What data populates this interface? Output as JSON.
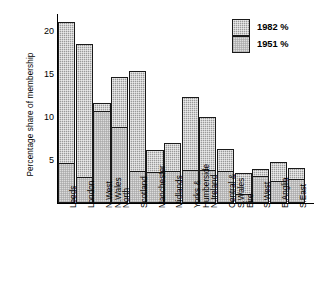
{
  "chart_data": {
    "type": "bar",
    "subtype": "stacked-vertical",
    "title": "",
    "xlabel": "",
    "ylabel": "Percentage share of membership",
    "ylim": [
      0,
      22
    ],
    "yticks": [
      5,
      10,
      15,
      20
    ],
    "ytick_labels": [
      "5",
      "10",
      "15",
      "20"
    ],
    "grid": false,
    "legend_position": "top-right",
    "categories": [
      "Leeds",
      "London",
      "N.West\nN.Wales",
      "North",
      "Scotland",
      "Manchester",
      "Midlands",
      "Yorks &\nHumberside",
      "N.Ireland",
      "Central &\nS.Wales",
      "Eire",
      "S.West",
      "E.Anglia",
      "S.East"
    ],
    "series": [
      {
        "name": "1982 %",
        "fill": "dark-hatch",
        "color": "#9a9a9a",
        "values": [
          21.1,
          18.5,
          11.6,
          14.7,
          15.3,
          6.1,
          7.0,
          12.3,
          10.0,
          6.2,
          3.5,
          3.9,
          4.7,
          4.0
        ]
      },
      {
        "name": "1951 %",
        "fill": "light-hatch",
        "color": "#dcdcdc",
        "values": [
          4.7,
          3.0,
          10.7,
          8.8,
          3.7,
          3.6,
          3.7,
          3.8,
          3.8,
          3.7,
          1.0,
          3.1,
          2.5,
          2.8
        ]
      }
    ],
    "note": "Each column is a stacked bar: the light (1951 %) segment sits at the bottom and the dark hatched (1982 %) segment is drawn as an overlay whose top equals the 1982 value."
  },
  "legend": {
    "items": [
      {
        "label": "1982 %",
        "swatch": "dark-hatch"
      },
      {
        "label": "1951 %",
        "swatch": "light-hatch"
      }
    ]
  }
}
